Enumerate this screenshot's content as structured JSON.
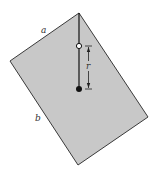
{
  "diagram": {
    "plate": {
      "fill": "#c8c8c8",
      "stroke": "#3a3a3a",
      "vertices": [
        [
          79,
          13
        ],
        [
          148,
          117
        ],
        [
          78,
          165
        ],
        [
          10,
          61
        ]
      ]
    },
    "suspension_line": {
      "from": [
        79,
        13
      ],
      "to": [
        79,
        89
      ],
      "color": "#111111"
    },
    "pivot_point": {
      "type": "open-circle",
      "x": 79,
      "y": 46
    },
    "center_of_mass": {
      "type": "filled-dot",
      "x": 79,
      "y": 89
    },
    "dimension": {
      "label": "r",
      "x": 88,
      "y_start": 46,
      "y_end": 89
    },
    "labels": {
      "side_a": "a",
      "side_b": "b"
    }
  }
}
